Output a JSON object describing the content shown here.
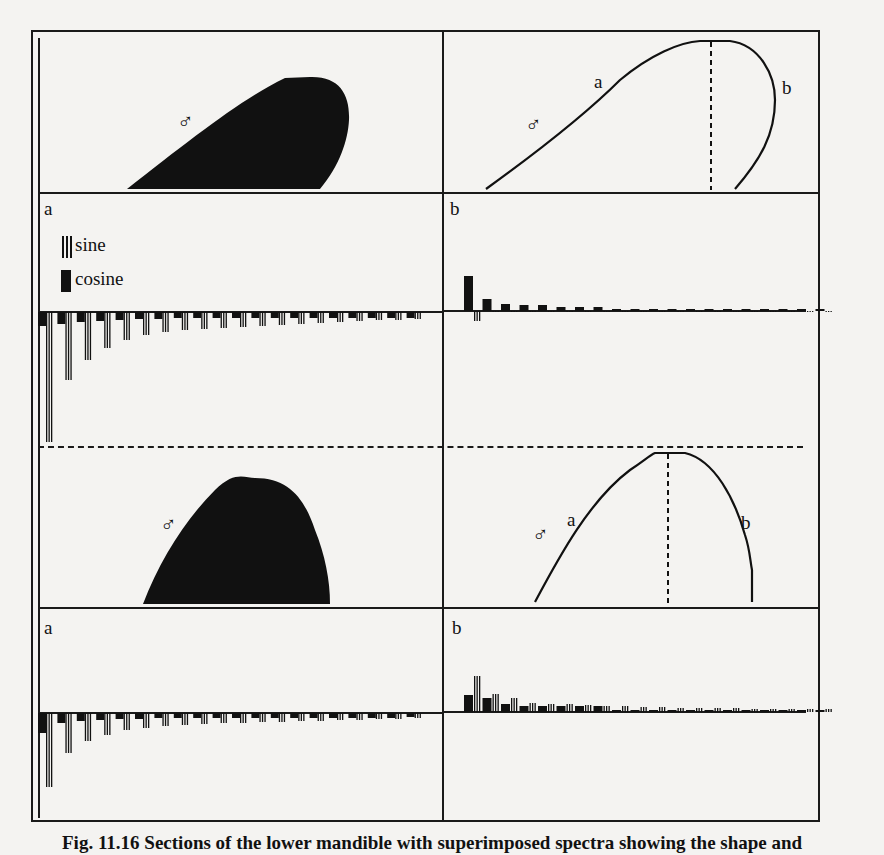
{
  "figure": {
    "caption": "Fig. 11.16 Sections of the lower mandible with superimposed spectra showing the shape and",
    "symbol": "♂",
    "panel_labels": {
      "left": "a",
      "right": "b"
    },
    "legend": {
      "sine": "sine",
      "cosine": "cosine"
    },
    "curve_labels": {
      "a": "a",
      "b": "b"
    }
  },
  "chart_data": [
    {
      "type": "bar",
      "title": "Top row, panel a: Fourier spectrum (outline a)",
      "legend": [
        "sine",
        "cosine"
      ],
      "x": [
        1,
        2,
        3,
        4,
        5,
        6,
        7,
        8,
        9,
        10,
        11,
        12,
        13,
        14,
        15,
        16,
        17,
        18,
        19,
        20
      ],
      "series": [
        {
          "name": "sine",
          "values": [
            -130,
            -68,
            -48,
            -36,
            -28,
            -23,
            -20,
            -18,
            -17,
            -16,
            -15,
            -14,
            -13,
            -12,
            -11,
            -10,
            -9,
            -8,
            -8,
            -7
          ]
        },
        {
          "name": "cosine",
          "values": [
            -14,
            -12,
            -10,
            -9,
            -8,
            -7,
            -7,
            -6,
            -6,
            -6,
            -6,
            -6,
            -6,
            -6,
            -6,
            -6,
            -6,
            -6,
            -6,
            -6
          ]
        }
      ],
      "grid": false
    },
    {
      "type": "bar",
      "title": "Top row, panel b: Fourier spectrum (outline b)",
      "legend": [
        "sine",
        "cosine"
      ],
      "x": [
        1,
        2,
        3,
        4,
        5,
        6,
        7,
        8,
        9,
        10,
        11,
        12,
        13,
        14,
        15,
        16,
        17,
        18,
        19,
        20
      ],
      "series": [
        {
          "name": "sine",
          "values": [
            -10,
            -1,
            -1,
            -1,
            -1,
            -1,
            -1,
            -1,
            -1,
            -1,
            -1,
            -1,
            -1,
            -1,
            -1,
            -1,
            -1,
            -1,
            -1,
            -1
          ]
        },
        {
          "name": "cosine",
          "values": [
            35,
            12,
            7,
            6,
            6,
            4,
            4,
            4,
            2,
            2,
            2,
            2,
            2,
            2,
            2,
            2,
            2,
            2,
            2,
            2
          ]
        }
      ],
      "grid": false
    },
    {
      "type": "bar",
      "title": "Bottom row, panel a: Fourier spectrum (outline a)",
      "legend": [
        "sine",
        "cosine"
      ],
      "x": [
        1,
        2,
        3,
        4,
        5,
        6,
        7,
        8,
        9,
        10,
        11,
        12,
        13,
        14,
        15,
        16,
        17,
        18,
        19,
        20
      ],
      "series": [
        {
          "name": "sine",
          "values": [
            -74,
            -40,
            -28,
            -22,
            -17,
            -15,
            -13,
            -12,
            -11,
            -10,
            -10,
            -9,
            -9,
            -8,
            -8,
            -7,
            -7,
            -6,
            -6,
            -5
          ]
        },
        {
          "name": "cosine",
          "values": [
            -20,
            -10,
            -8,
            -7,
            -6,
            -6,
            -5,
            -5,
            -5,
            -5,
            -5,
            -5,
            -5,
            -5,
            -5,
            -5,
            -5,
            -5,
            -5,
            -4
          ]
        }
      ],
      "grid": false
    },
    {
      "type": "bar",
      "title": "Bottom row, panel b: Fourier spectrum (outline b)",
      "legend": [
        "sine",
        "cosine"
      ],
      "x": [
        1,
        2,
        3,
        4,
        5,
        6,
        7,
        8,
        9,
        10,
        11,
        12,
        13,
        14,
        15,
        16,
        17,
        18,
        19,
        20
      ],
      "series": [
        {
          "name": "sine",
          "values": [
            36,
            18,
            14,
            9,
            8,
            8,
            7,
            6,
            6,
            5,
            5,
            4,
            4,
            4,
            4,
            3,
            3,
            3,
            3,
            3
          ]
        },
        {
          "name": "cosine",
          "values": [
            17,
            14,
            8,
            6,
            6,
            6,
            6,
            6,
            2,
            2,
            2,
            2,
            2,
            2,
            2,
            2,
            2,
            2,
            2,
            2
          ]
        }
      ],
      "grid": false
    }
  ]
}
